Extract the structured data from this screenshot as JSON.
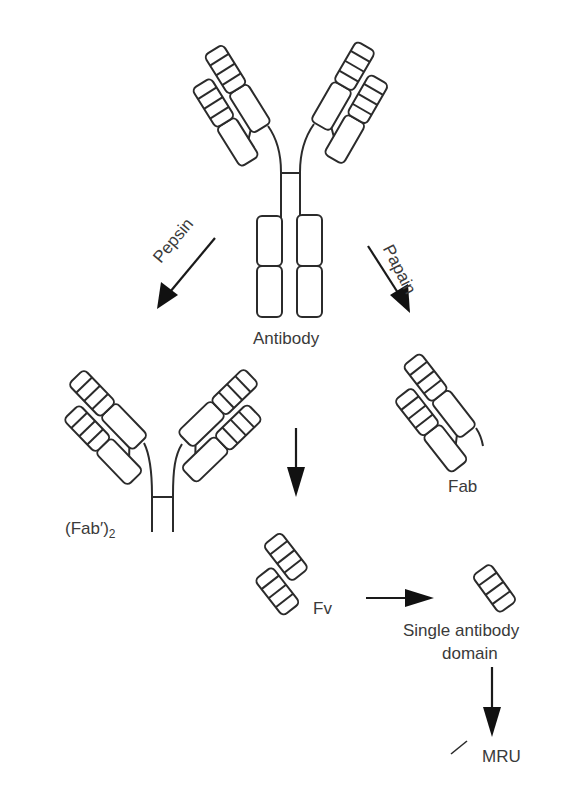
{
  "figure": {
    "labels": {
      "antibody": "Antibody",
      "pepsin": "Pepsin",
      "papain": "Papain",
      "fab2_main": "(Fab′)",
      "fab2_sub": "2",
      "fab": "Fab",
      "fv": "Fv",
      "single_domain_line1": "Single antibody",
      "single_domain_line2": "domain",
      "mru": "MRU"
    }
  },
  "nodes": [
    {
      "id": "antibody",
      "label": "Antibody"
    },
    {
      "id": "fab2",
      "label": "(Fab′)2"
    },
    {
      "id": "fab",
      "label": "Fab"
    },
    {
      "id": "fv",
      "label": "Fv"
    },
    {
      "id": "single_domain",
      "label": "Single antibody domain"
    },
    {
      "id": "mru",
      "label": "MRU"
    }
  ],
  "edges": [
    {
      "from": "antibody",
      "to": "fab2",
      "label": "Pepsin"
    },
    {
      "from": "antibody",
      "to": "fab",
      "label": "Papain"
    },
    {
      "from": "fab2",
      "to": "fv",
      "label": ""
    },
    {
      "from": "fv",
      "to": "single_domain",
      "label": ""
    },
    {
      "from": "single_domain",
      "to": "mru",
      "label": ""
    }
  ],
  "colors": {
    "stroke": "#2b2b2b",
    "arrow": "#111111",
    "text": "#3a3a3a",
    "background": "#ffffff"
  }
}
